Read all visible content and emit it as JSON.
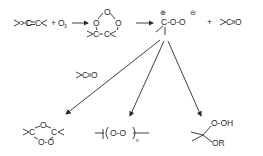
{
  "diagram": {
    "reactants": {
      "alkene": {
        "left": ">C",
        "bond": "=",
        "right": "C<"
      },
      "plus": "+",
      "ozone": "O",
      "ozone_sub": "3"
    },
    "primary_ozonide": {
      "top_o": "O",
      "left_o": "O",
      "right_o": "O",
      "bottom": "C-C"
    },
    "carbonyl_oxide": {
      "c": "C",
      "o1": "-O-",
      "o2": "O",
      "pos_charge": "⊕",
      "neg_charge": "⊖"
    },
    "plus2": "+",
    "carbonyl": {
      "label": ">C=O"
    },
    "carbonyl_reagent": {
      "label": ">C=O"
    },
    "products": [
      {
        "name": "secondary-ozonide",
        "c_left": "C",
        "o_top": "O",
        "c_right": "C",
        "o_bottom": "O-O"
      },
      {
        "name": "polymeric-peroxide",
        "repeat": "O-O",
        "subscript": "n"
      },
      {
        "name": "alkoxy-hydroperoxide",
        "top": "O-OH",
        "bottom": "OR"
      }
    ]
  }
}
